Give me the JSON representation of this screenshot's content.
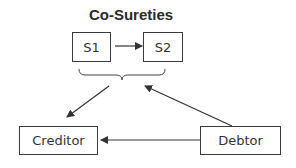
{
  "title": "Co-Sureties",
  "nodes": {
    "s1": "S1",
    "s2": "S2",
    "creditor": "Creditor",
    "debtor": "Debtor"
  },
  "edges": [
    {
      "from": "S1",
      "to": "S2"
    },
    {
      "from": "Co-Sureties",
      "to": "Creditor"
    },
    {
      "from": "Debtor",
      "to": "Co-Sureties"
    },
    {
      "from": "Debtor",
      "to": "Creditor"
    }
  ],
  "colors": {
    "stroke": "#3a3a3a",
    "text": "#333333"
  }
}
